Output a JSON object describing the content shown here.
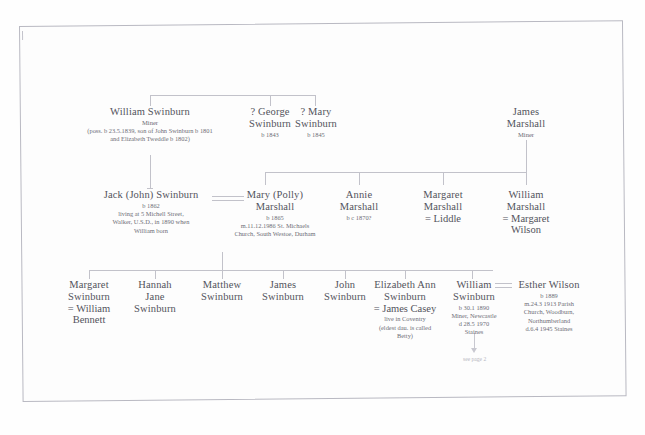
{
  "document": {
    "type": "family-tree-chart",
    "surname_focus": "Swinburn",
    "page_note": "see page 2"
  },
  "generations": [
    {
      "label": "generation-1",
      "nodes": [
        {
          "id": "william-swinburn-sr",
          "name": "William Swinburn",
          "occupation": "Miner",
          "details": "(poss. b 23.5.1839, son of John Swinburn b 1801 and Elizabeth Tweddle b 1802)"
        },
        {
          "id": "george-swinburn",
          "name_line1": "? George",
          "name_line2": "Swinburn",
          "details": "b 1843"
        },
        {
          "id": "mary-swinburn",
          "name_line1": "? Mary",
          "name_line2": "Swinburn",
          "details": "b 1845"
        },
        {
          "id": "james-marshall",
          "name_line1": "James",
          "name_line2": "Marshall",
          "occupation": "Miner"
        }
      ]
    },
    {
      "label": "generation-2",
      "nodes": [
        {
          "id": "jack-john-swinburn",
          "name": "Jack (John) Swinburn",
          "details": "b 1862\nliving at 5 Michell Street,\nWalker, U.S.D., in 1890 when\nWilliam born"
        },
        {
          "id": "mary-polly-marshall",
          "name_line1": "Mary (Polly)",
          "name_line2": "Marshall",
          "details": "b 1865\nm.11.12.1986 St. Michaels\nChurch, South Westoe, Durham"
        },
        {
          "id": "annie-marshall",
          "name_line1": "Annie",
          "name_line2": "Marshall",
          "details": "b c 1870?"
        },
        {
          "id": "margaret-marshall",
          "name_line1": "Margaret",
          "name_line2": "Marshall",
          "spouse": "= Liddle"
        },
        {
          "id": "william-marshall",
          "name_line1": "William",
          "name_line2": "Marshall",
          "spouse_line1": "= Margaret",
          "spouse_line2": "Wilson"
        }
      ]
    },
    {
      "label": "generation-3",
      "nodes": [
        {
          "id": "margaret-swinburn",
          "name_line1": "Margaret",
          "name_line2": "Swinburn",
          "spouse_line1": "= William",
          "spouse_line2": "Bennett"
        },
        {
          "id": "hannah-jane-swinburn",
          "name_line1": "Hannah",
          "name_line2": "Jane",
          "name_line3": "Swinburn"
        },
        {
          "id": "matthew-swinburn",
          "name_line1": "Matthew",
          "name_line2": "Swinburn"
        },
        {
          "id": "james-swinburn",
          "name_line1": "James",
          "name_line2": "Swinburn"
        },
        {
          "id": "john-swinburn",
          "name_line1": "John",
          "name_line2": "Swinburn"
        },
        {
          "id": "elizabeth-ann-swinburn",
          "name_line1": "Elizabeth Ann",
          "name_line2": "Swinburn",
          "spouse": "= James Casey",
          "details": "live in Coventry\n(eldest dau. is called\nBetty)"
        },
        {
          "id": "william-swinburn-jr",
          "name_line1": "William",
          "name_line2": "Swinburn",
          "details": "b 30.1 1890\nMiner, Newcastle\nd 28.5 1970\nStaines"
        },
        {
          "id": "esther-wilson",
          "name": "Esther Wilson",
          "details": "b 1889\nm.24.3 1913 Parish\nChurch, Woodburn,\nNorthumberland\nd.6.4 1945 Staines"
        }
      ]
    }
  ],
  "colors": {
    "ink": "#53535c",
    "faint_ink": "#6e6e77",
    "line": "#c2c2ca",
    "paper": "#fdfdfd",
    "border": "#b9b9c2"
  }
}
